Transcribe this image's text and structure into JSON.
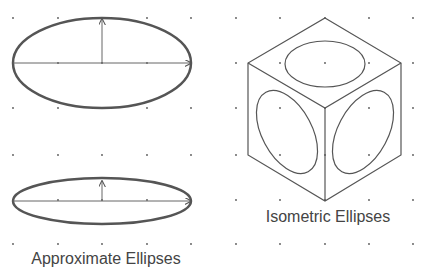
{
  "labels": {
    "approximate": "Approximate Ellipses",
    "isometric": "Isometric Ellipses"
  },
  "colors": {
    "stroke": "#555555",
    "dot": "#555555",
    "text": "#444444",
    "background": "#ffffff"
  },
  "grid": {
    "xs": [
      13,
      58,
      102,
      147,
      191,
      236,
      280,
      325,
      369,
      413
    ],
    "ys": [
      18,
      63,
      108,
      155,
      200,
      244
    ]
  },
  "approximate_ellipses": [
    {
      "cx": 102,
      "cy": 63,
      "rx": 89,
      "ry": 45,
      "minor_arrow_to_y": 18
    },
    {
      "cx": 102,
      "cy": 200,
      "rx": 89,
      "ry": 23,
      "minor_arrow_to_y": 180
    }
  ],
  "isometric_cube": {
    "vertices": {
      "top": [
        325,
        18
      ],
      "left": [
        248,
        63
      ],
      "right": [
        401,
        63
      ],
      "center": [
        325,
        108
      ],
      "lower_left": [
        248,
        155
      ],
      "lower_right": [
        401,
        155
      ],
      "bottom": [
        325,
        201
      ]
    },
    "ellipses": [
      {
        "face": "top",
        "cx": 325,
        "cy": 64,
        "rx": 40,
        "ry": 24,
        "rotate": 0
      },
      {
        "face": "left",
        "cx": 287,
        "cy": 132,
        "rx": 24,
        "ry": 44,
        "rotate": -30
      },
      {
        "face": "right",
        "cx": 363,
        "cy": 132,
        "rx": 24,
        "ry": 44,
        "rotate": 30
      }
    ]
  }
}
